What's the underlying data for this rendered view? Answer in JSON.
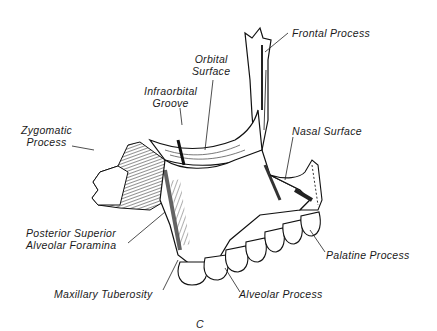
{
  "figure": {
    "panel_letter": "C",
    "labels": [
      {
        "id": "frontal-process",
        "text": "Frontal Process"
      },
      {
        "id": "orbital-surface",
        "lines": [
          "Orbital",
          "Surface"
        ]
      },
      {
        "id": "infraorbital-groove",
        "lines": [
          "Infraorbital",
          "Groove"
        ]
      },
      {
        "id": "zygomatic-process",
        "lines": [
          "Zygomatic",
          "Process"
        ]
      },
      {
        "id": "nasal-surface",
        "text": "Nasal Surface"
      },
      {
        "id": "posterior-superior-alveolar-foramina",
        "lines": [
          "Posterior Superior",
          "Alveolar Foramina"
        ]
      },
      {
        "id": "palatine-process",
        "text": "Palatine Process"
      },
      {
        "id": "maxillary-tuberosity",
        "text": "Maxillary Tuberosity"
      },
      {
        "id": "alveolar-process",
        "text": "Alveolar Process"
      }
    ]
  }
}
